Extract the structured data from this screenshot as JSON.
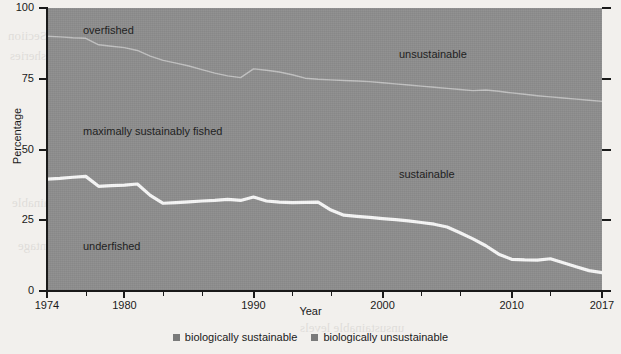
{
  "chart_data": {
    "type": "area",
    "title": "",
    "xlabel": "Year",
    "ylabel": "Percentage",
    "xlim": [
      1974,
      2017
    ],
    "ylim": [
      0,
      100
    ],
    "grid": false,
    "legend_position": "bottom-center",
    "x_ticks": [
      {
        "value": 1974,
        "label": "1974"
      },
      {
        "value": 1980,
        "label": "1980"
      },
      {
        "value": 1990,
        "label": "1990"
      },
      {
        "value": 2000,
        "label": "2000"
      },
      {
        "value": 2010,
        "label": "2010"
      },
      {
        "value": 2017,
        "label": "2017"
      }
    ],
    "x_minor_ticks": [
      1977,
      1983,
      1986,
      1993,
      1996,
      2003,
      2006,
      2013
    ],
    "y_ticks": [
      {
        "value": 0,
        "label": "0"
      },
      {
        "value": 25,
        "label": "25"
      },
      {
        "value": 50,
        "label": "50"
      },
      {
        "value": 75,
        "label": "75"
      },
      {
        "value": 100,
        "label": "100"
      }
    ],
    "x": [
      1974,
      1975,
      1976,
      1977,
      1978,
      1979,
      1980,
      1981,
      1982,
      1983,
      1984,
      1985,
      1986,
      1987,
      1988,
      1989,
      1990,
      1991,
      1992,
      1993,
      1994,
      1995,
      1996,
      1997,
      1998,
      1999,
      2000,
      2001,
      2002,
      2003,
      2004,
      2005,
      2006,
      2007,
      2008,
      2009,
      2010,
      2011,
      2012,
      2013,
      2014,
      2015,
      2016,
      2017
    ],
    "series": [
      {
        "name": "underfished",
        "description": "lower boundary line: cumulative percentage of underfished stocks",
        "values": [
          39.5,
          39.8,
          40.2,
          40.5,
          37.0,
          37.2,
          37.4,
          37.8,
          33.8,
          31.0,
          31.2,
          31.5,
          31.8,
          32.0,
          32.4,
          32.0,
          33.2,
          31.8,
          31.4,
          31.2,
          31.3,
          31.4,
          28.6,
          26.8,
          26.4,
          26.0,
          25.6,
          25.2,
          24.8,
          24.2,
          23.6,
          22.6,
          20.6,
          18.4,
          16.0,
          13.0,
          11.2,
          11.0,
          10.9,
          11.4,
          10.0,
          8.6,
          7.2,
          6.5
        ]
      },
      {
        "name": "maximally sustainably fished upper boundary",
        "description": "upper boundary line: cumulative sustainable percentage (underfished + maximally sustainably fished)",
        "values": [
          90.0,
          89.8,
          89.5,
          89.3,
          87.0,
          86.5,
          86.0,
          85.0,
          83.0,
          81.5,
          80.5,
          79.5,
          78.2,
          77.0,
          76.0,
          75.4,
          78.5,
          78.0,
          77.4,
          76.4,
          75.2,
          74.8,
          74.6,
          74.4,
          74.2,
          74.0,
          73.6,
          73.2,
          72.8,
          72.4,
          72.0,
          71.6,
          71.2,
          70.8,
          71.0,
          70.6,
          70.0,
          69.5,
          69.0,
          68.6,
          68.2,
          67.8,
          67.4,
          67.0
        ]
      }
    ],
    "regions": [
      {
        "name": "overfished",
        "label": "overfished"
      },
      {
        "name": "maximally-sustainably-fished",
        "label": "maximally sustainably fished"
      },
      {
        "name": "underfished",
        "label": "underfished"
      },
      {
        "name": "unsustainable",
        "label": "unsustainable"
      },
      {
        "name": "sustainable",
        "label": "sustainable"
      }
    ],
    "legend": [
      {
        "label": "biologically sustainable",
        "color": "#7a7a7a"
      },
      {
        "label": "biologically unsustainable",
        "color": "#7a7a7a"
      }
    ],
    "colors": {
      "plot_fill": "#8d8d8d",
      "divider_line": "#f5f5f5",
      "axis": "#1a1a1a",
      "text": "#1a1a1a",
      "page_background": "#f2f0ed"
    }
  },
  "annotations": {
    "overfished": "overfished",
    "maximally_sustainably_fished": "maximally sustainably fished",
    "underfished": "underfished",
    "unsustainable": "unsustainable",
    "sustainable": "sustainable"
  },
  "axes": {
    "x_title": "Year",
    "y_title": "Percentage"
  },
  "bleed_text": {
    "l1": "the Seciion",
    "l2": "fisheries",
    "l3": "and the state of",
    "l4": "recorded stocks",
    "l5": "biologically sustainable",
    "l6": "of the percentage",
    "l7": "unsustainable levels"
  }
}
